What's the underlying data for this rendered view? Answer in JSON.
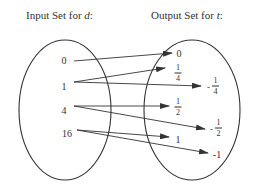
{
  "diagram": {
    "type": "mapping-diagram",
    "input_title": {
      "text": "Input Set for ",
      "var": "d",
      "suffix": ":"
    },
    "output_title": {
      "text": "Output Set for ",
      "var": "t",
      "suffix": ":"
    },
    "inputs": [
      "0",
      "1",
      "4",
      "16"
    ],
    "outputs": [
      {
        "id": "o0",
        "display": "0"
      },
      {
        "id": "o1",
        "display": "1/4",
        "num": "1",
        "den": "4",
        "neg": false
      },
      {
        "id": "o2",
        "display": "-1/4",
        "num": "1",
        "den": "4",
        "neg": true
      },
      {
        "id": "o3",
        "display": "1/2",
        "num": "1",
        "den": "2",
        "neg": false
      },
      {
        "id": "o4",
        "display": "-1/2",
        "num": "1",
        "den": "2",
        "neg": true
      },
      {
        "id": "o5",
        "display": "1"
      },
      {
        "id": "o6",
        "display": "-1"
      }
    ],
    "mappings": [
      {
        "from": "0",
        "to": "0"
      },
      {
        "from": "1",
        "to": "1/4"
      },
      {
        "from": "1",
        "to": "-1/4"
      },
      {
        "from": "4",
        "to": "1/2"
      },
      {
        "from": "4",
        "to": "-1/2"
      },
      {
        "from": "16",
        "to": "1"
      },
      {
        "from": "16",
        "to": "-1"
      }
    ],
    "colors": {
      "stroke": "#333333",
      "background": "#ffffff"
    }
  }
}
